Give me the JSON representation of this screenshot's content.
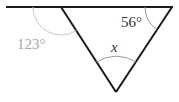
{
  "diagram": {
    "type": "geometry",
    "labels": {
      "exterior_angle": "123°",
      "right_angle": "56°",
      "unknown_angle": "x"
    },
    "colors": {
      "lines": "#1a1a1a",
      "arc": "#9a9a9a",
      "exterior_label": "#a8a8a8",
      "text": "#333333"
    }
  }
}
